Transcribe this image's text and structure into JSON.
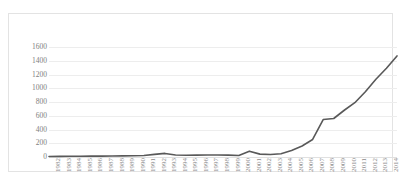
{
  "caption": {
    "text": " "
  },
  "chart_data": {
    "type": "line",
    "title": "",
    "subtitle": "",
    "xlabel": "",
    "ylabel": "",
    "grid": true,
    "legend": false,
    "legend_position": "none",
    "line_color": "#595959",
    "gridline_color": "#ededed",
    "axis_label_color": "#808080",
    "ylim": [
      0,
      1600
    ],
    "ytick_labels": [
      "1600",
      "1400",
      "1200",
      "1000",
      "800",
      "600",
      "400",
      "200",
      "0"
    ],
    "yticks": [
      1600,
      1400,
      1200,
      1000,
      800,
      600,
      400,
      200,
      0
    ],
    "categories": [
      "1982",
      "1983",
      "1984",
      "1985",
      "1986",
      "1987",
      "1988",
      "1989",
      "1990",
      "1991",
      "1992",
      "1993",
      "1994",
      "1995",
      "1996",
      "1997",
      "1998",
      "1999",
      "2000",
      "2001",
      "2002",
      "2003",
      "2004",
      "2005",
      "2006",
      "2007",
      "2008",
      "2009",
      "2010",
      "2011",
      "2012",
      "2013",
      "2014",
      "2015"
    ],
    "values": [
      8,
      9,
      10,
      11,
      12,
      13,
      15,
      17,
      19,
      22,
      38,
      52,
      30,
      26,
      28,
      30,
      30,
      28,
      22,
      85,
      42,
      36,
      48,
      95,
      160,
      255,
      545,
      560,
      680,
      790,
      950,
      1130,
      1290,
      1470
    ]
  }
}
